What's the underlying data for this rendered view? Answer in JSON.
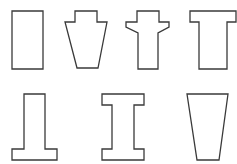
{
  "diagram": {
    "stroke_color": "#3a3a3a",
    "fill_color": "#ffffff",
    "shapes": [
      {
        "name": "rectangle",
        "row": 1,
        "col": 1,
        "points": "12,11 43,11 43,69 12,69"
      },
      {
        "name": "keystone",
        "row": 1,
        "col": 2,
        "points": "75,11 97,11 97,22 107,22 98,68 77,68 65,22 75,22"
      },
      {
        "name": "flanged-post",
        "row": 1,
        "col": 3,
        "points": "137,11 159,11 159,22 169,22 169,27 158,33 158,69 138,69 138,33 126,27 126,22 137,22"
      },
      {
        "name": "t-section",
        "row": 1,
        "col": 4,
        "points": "190,11 236,11 236,22 227,22 227,69 199,69 199,22 190,22"
      },
      {
        "name": "inverted-t-section",
        "row": 2,
        "col": 1,
        "points": "24,94 45,94 45,149 57,149 57,160 12,160 12,149 24,149"
      },
      {
        "name": "i-beam",
        "row": 2,
        "col": 2,
        "points": "102,94 144,94 144,105 134,105 134,149 144,149 144,160 102,160 102,149 112,149 112,105 102,105"
      },
      {
        "name": "trapezoid",
        "row": 2,
        "col": 3,
        "points": "187,94 228,94 219,160 197,160"
      }
    ]
  }
}
